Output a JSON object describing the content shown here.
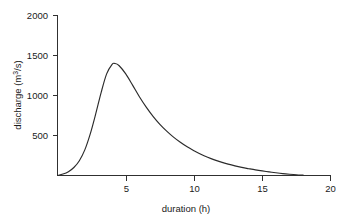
{
  "chart_data": {
    "type": "line",
    "title": "",
    "subtitle": "",
    "xlabel": "duration (h)",
    "ylabel_parts": {
      "base": "discharge (m",
      "exponent": "3",
      "tail": "/s)"
    },
    "ylabel": "discharge (m3/s)",
    "xlim": [
      0,
      20
    ],
    "ylim": [
      0,
      2000
    ],
    "xticks": [
      0,
      5,
      10,
      15,
      20
    ],
    "xtick_labels": [
      "",
      "5",
      "10",
      "15",
      "20"
    ],
    "yticks": [
      0,
      500,
      1000,
      1500,
      2000
    ],
    "ytick_labels": [
      "",
      "500",
      "1000",
      "1500",
      "2000"
    ],
    "grid": false,
    "legend": false,
    "legend_position": "none",
    "series": [
      {
        "name": "storm hydrograph",
        "color": "#2b2b2b",
        "x": [
          0.0,
          0.4,
          0.8,
          1.2,
          1.6,
          2.0,
          2.4,
          2.8,
          3.2,
          3.6,
          4.0,
          4.2,
          4.5,
          5.0,
          5.5,
          6.0,
          6.5,
          7.0,
          7.5,
          8.0,
          8.5,
          9.0,
          9.5,
          10.0,
          10.5,
          11.0,
          11.5,
          12.0,
          12.5,
          13.0,
          13.5,
          14.0,
          14.5,
          15.0,
          15.5,
          16.0,
          16.5,
          17.0,
          17.5,
          18.0
        ],
        "y": [
          0,
          18,
          48,
          100,
          185,
          320,
          520,
          770,
          1040,
          1270,
          1390,
          1400,
          1375,
          1270,
          1130,
          985,
          855,
          740,
          640,
          555,
          480,
          415,
          358,
          310,
          266,
          228,
          195,
          167,
          142,
          120,
          101,
          85,
          70,
          57,
          45,
          34,
          24,
          16,
          9,
          4
        ]
      }
    ],
    "peak": {
      "x": 4.2,
      "y": 1400
    }
  },
  "figure": {
    "background_color": "#ffffff",
    "axis_color": "#303030",
    "text_color": "#1a1a1a"
  }
}
